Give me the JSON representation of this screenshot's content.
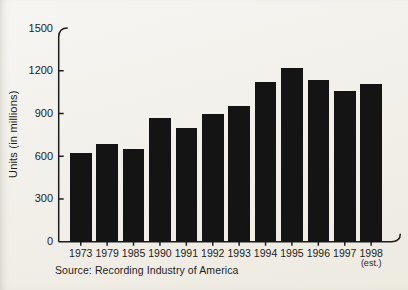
{
  "page": {
    "background_top": "#f6f5f2",
    "background_bottom": "#edeae0",
    "text_color": "#1c1c1c"
  },
  "chart_data": {
    "type": "bar",
    "title": "",
    "ylabel": "Units (in millions)",
    "xlabel": "",
    "source": "Source: Recording Industry of America",
    "categories": [
      "1973",
      "1979",
      "1985",
      "1990",
      "1991",
      "1992",
      "1993",
      "1994",
      "1995",
      "1996",
      "1997",
      "1998"
    ],
    "last_category_note": "(est.)",
    "values": [
      620,
      685,
      650,
      865,
      800,
      895,
      955,
      1120,
      1220,
      1135,
      1060,
      1110
    ],
    "ylim": [
      0,
      1500
    ],
    "yticks": [
      0,
      300,
      600,
      900,
      1200,
      1500
    ],
    "grid": false,
    "legend": null,
    "bar_color": "#141414",
    "axis_color": "#1c1c1c"
  }
}
